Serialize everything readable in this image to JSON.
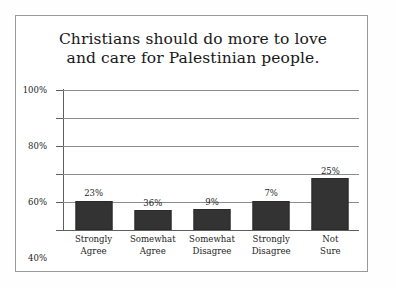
{
  "chart_data": {
    "type": "bar",
    "title": "Christians should do more to love and care for Palestinian people.",
    "title_lines": [
      "Christians should do more to love",
      "and care for Palestinian people."
    ],
    "xlabel": "",
    "ylabel": "",
    "ylim": [
      0,
      100
    ],
    "grid": true,
    "legend": "none",
    "yticks": [
      0,
      20,
      40,
      60,
      80,
      100
    ],
    "ytick_labels": [
      "0%",
      "20%",
      "40%",
      "60%",
      "80%",
      "100%"
    ],
    "categories": [
      "Strongly Agree",
      "Somewhat Agree",
      "Somewhat Disagree",
      "Strongly Disagree",
      "Not Sure"
    ],
    "category_lines": [
      [
        "Strongly",
        "Agree"
      ],
      [
        "Somewhat",
        "Agree"
      ],
      [
        "Somewhat",
        "Disagree"
      ],
      [
        "Strongly",
        "Disagree"
      ],
      [
        "Not",
        "Sure"
      ]
    ],
    "values": [
      23,
      36,
      9,
      7,
      25
    ],
    "data_labels": [
      "23%",
      "36%",
      "9%",
      "7%",
      "25%"
    ],
    "drawn_heights": [
      21,
      14,
      15,
      21,
      37
    ],
    "bar_color": "#333333",
    "gridline_color": "#8d8d8d",
    "axis_color": "#5e5e5e"
  }
}
